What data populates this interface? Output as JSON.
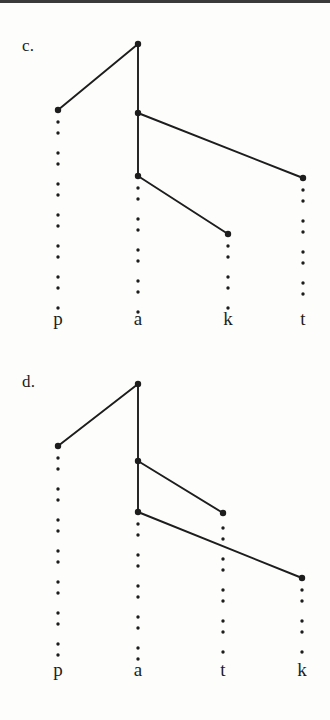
{
  "figure": {
    "title_rule": true,
    "ink_color": "#1d1d1d",
    "background": "#fdfdfc"
  },
  "panels": [
    {
      "tag": "c.",
      "tag_x": 22,
      "tag_y": 36,
      "columns": [
        {
          "label": "p",
          "x": 58,
          "label_y": 322,
          "dots_from": 122,
          "dots_to": 312
        },
        {
          "label": "a",
          "x": 138,
          "label_y": 322,
          "dots_from": 188,
          "dots_to": 312
        },
        {
          "label": "k",
          "x": 228,
          "label_y": 322,
          "dots_from": 246,
          "dots_to": 312
        },
        {
          "label": "t",
          "x": 303,
          "label_y": 322,
          "dots_from": 190,
          "dots_to": 312
        }
      ],
      "nodes": [
        {
          "name": "node-a-root",
          "x": 138,
          "y": 44
        },
        {
          "name": "node-p",
          "x": 58,
          "y": 110
        },
        {
          "name": "node-a-second",
          "x": 138,
          "y": 113
        },
        {
          "name": "node-a-third",
          "x": 138,
          "y": 176
        },
        {
          "name": "node-t",
          "x": 303,
          "y": 178
        },
        {
          "name": "node-k",
          "x": 228,
          "y": 234
        }
      ],
      "edges": [
        {
          "name": "edge-a-root-to-p",
          "x1": 138,
          "y1": 44,
          "x2": 58,
          "y2": 110
        },
        {
          "name": "edge-a-root-to-a2",
          "x1": 138,
          "y1": 44,
          "x2": 138,
          "y2": 113
        },
        {
          "name": "edge-a2-to-t",
          "x1": 138,
          "y1": 113,
          "x2": 303,
          "y2": 178
        },
        {
          "name": "edge-a2-to-a3",
          "x1": 138,
          "y1": 113,
          "x2": 138,
          "y2": 176
        },
        {
          "name": "edge-a3-to-k",
          "x1": 138,
          "y1": 176,
          "x2": 228,
          "y2": 234
        }
      ]
    },
    {
      "tag": "d.",
      "tag_x": 22,
      "tag_y": 372,
      "columns": [
        {
          "label": "p",
          "x": 58,
          "label_y": 673,
          "dots_from": 458,
          "dots_to": 662
        },
        {
          "label": "a",
          "x": 138,
          "label_y": 673,
          "dots_from": 524,
          "dots_to": 662
        },
        {
          "label": "t",
          "x": 223,
          "label_y": 673,
          "dots_from": 528,
          "dots_to": 662
        },
        {
          "label": "k",
          "x": 302,
          "label_y": 673,
          "dots_from": 590,
          "dots_to": 662
        }
      ],
      "nodes": [
        {
          "name": "node-a-root",
          "x": 138,
          "y": 384
        },
        {
          "name": "node-p",
          "x": 58,
          "y": 446
        },
        {
          "name": "node-a-second",
          "x": 138,
          "y": 461
        },
        {
          "name": "node-a-third",
          "x": 138,
          "y": 512
        },
        {
          "name": "node-t",
          "x": 223,
          "y": 513
        },
        {
          "name": "node-k",
          "x": 302,
          "y": 578
        }
      ],
      "edges": [
        {
          "name": "edge-a-root-to-p",
          "x1": 138,
          "y1": 384,
          "x2": 58,
          "y2": 446
        },
        {
          "name": "edge-a-root-to-a2",
          "x1": 138,
          "y1": 384,
          "x2": 138,
          "y2": 461
        },
        {
          "name": "edge-a2-to-t",
          "x1": 138,
          "y1": 461,
          "x2": 223,
          "y2": 513
        },
        {
          "name": "edge-a2-to-a3",
          "x1": 138,
          "y1": 461,
          "x2": 138,
          "y2": 512
        },
        {
          "name": "edge-a3-to-k",
          "x1": 138,
          "y1": 512,
          "x2": 302,
          "y2": 578
        }
      ]
    }
  ]
}
